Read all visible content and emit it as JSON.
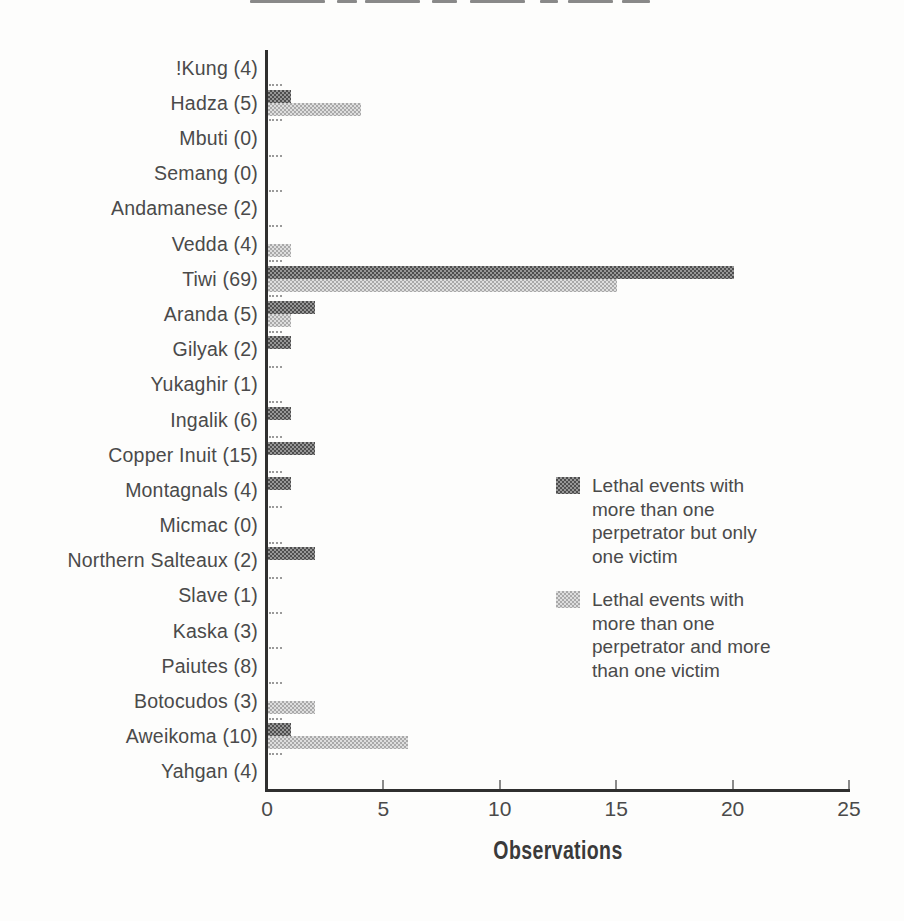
{
  "chart_data": {
    "type": "bar",
    "orientation": "horizontal",
    "xlabel": "Observations",
    "xlim": [
      0,
      25
    ],
    "x_ticks": [
      0,
      5,
      10,
      15,
      20,
      25
    ],
    "grid": false,
    "legend_position": "center-right",
    "categories": [
      "!Kung (4)",
      "Hadza (5)",
      "Mbuti (0)",
      "Semang (0)",
      "Andamanese (2)",
      "Vedda (4)",
      "Tiwi (69)",
      "Aranda (5)",
      "Gilyak (2)",
      "Yukaghir (1)",
      "Ingalik (6)",
      "Copper Inuit (15)",
      "Montagnals (4)",
      "Micmac (0)",
      "Northern Salteaux (2)",
      "Slave (1)",
      "Kaska (3)",
      "Paiutes (8)",
      "Botocudos (3)",
      "Aweikoma (10)",
      "Yahgan (4)"
    ],
    "series": [
      {
        "name": "Lethal events with more than one perpetrator but only one victim",
        "color": "#6f6f6f",
        "values": [
          0,
          1,
          0,
          0,
          0,
          0,
          20,
          2,
          1,
          0,
          1,
          2,
          1,
          0,
          2,
          0,
          0,
          0,
          0,
          1,
          0
        ]
      },
      {
        "name": "Lethal events with more than one perpetrator and more than one victim",
        "color": "#c2c2c2",
        "values": [
          0,
          4,
          0,
          0,
          0,
          1,
          15,
          1,
          0,
          0,
          0,
          0,
          0,
          0,
          0,
          0,
          0,
          0,
          2,
          6,
          0
        ]
      }
    ]
  },
  "legend": {
    "items": [
      {
        "series": 0,
        "color": "#6f6f6f",
        "lines": [
          "Lethal events with",
          "more than one",
          "perpetrator but only",
          "one victim"
        ]
      },
      {
        "series": 1,
        "color": "#c2c2c2",
        "lines": [
          "Lethal events with",
          "more than one",
          "perpetrator and more",
          "than one victim"
        ]
      }
    ]
  }
}
